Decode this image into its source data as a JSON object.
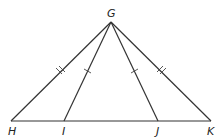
{
  "diagram": {
    "type": "geometry",
    "points": {
      "G": {
        "label": "G",
        "x": 111,
        "y": 22
      },
      "H": {
        "label": "H",
        "x": 11,
        "y": 121
      },
      "I": {
        "label": "I",
        "x": 64,
        "y": 121
      },
      "J": {
        "label": "J",
        "x": 158,
        "y": 121
      },
      "K": {
        "label": "K",
        "x": 211,
        "y": 121
      }
    },
    "segments": [
      "GH",
      "GI",
      "GJ",
      "GK",
      "HK"
    ],
    "congruence_marks": [
      {
        "segments": [
          "GH",
          "GK"
        ],
        "ticks": 2
      },
      {
        "segments": [
          "GI",
          "GJ"
        ],
        "ticks": 1
      }
    ],
    "colors": {
      "line": "#333333",
      "background": "#ffffff"
    }
  }
}
